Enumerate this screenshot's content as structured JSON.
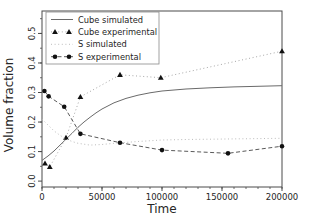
{
  "figure": {
    "background": "#ffffff",
    "axes_color": "#4a4a4a",
    "text_color": "#262626",
    "legend_border_color": "#8a8a8a"
  },
  "chart_data": {
    "type": "line",
    "title": "",
    "xlabel": "Time",
    "ylabel": "Volume fraction",
    "xlim": [
      0,
      200000
    ],
    "ylim": [
      -0.02,
      0.576
    ],
    "x_ticks": [
      0,
      50000,
      100000,
      150000,
      200000
    ],
    "x_tick_labels": [
      "0",
      "50000",
      "100000",
      "150000",
      "200000"
    ],
    "x_minor_step": 10000,
    "y_ticks": [
      0.0,
      0.1,
      0.2,
      0.3,
      0.4,
      0.5
    ],
    "y_tick_labels": [
      "0.0",
      "0.1",
      "0.2",
      "0.3",
      "0.4",
      "0.5"
    ],
    "y_minor_step": 0.05,
    "grid": false,
    "legend_position": "upper left",
    "series": [
      {
        "name": "Cube simulated",
        "style": "solid",
        "color": "#6a6a6a",
        "marker": "none",
        "marker_color": "#111111",
        "points": [
          [
            0,
            0.07
          ],
          [
            5000,
            0.085
          ],
          [
            10000,
            0.102
          ],
          [
            15000,
            0.122
          ],
          [
            20000,
            0.142
          ],
          [
            25000,
            0.162
          ],
          [
            30000,
            0.182
          ],
          [
            35000,
            0.2
          ],
          [
            40000,
            0.216
          ],
          [
            45000,
            0.231
          ],
          [
            50000,
            0.244
          ],
          [
            60000,
            0.265
          ],
          [
            70000,
            0.28
          ],
          [
            80000,
            0.291
          ],
          [
            90000,
            0.299
          ],
          [
            100000,
            0.305
          ],
          [
            120000,
            0.312
          ],
          [
            140000,
            0.316
          ],
          [
            160000,
            0.319
          ],
          [
            180000,
            0.321
          ],
          [
            200000,
            0.323
          ]
        ]
      },
      {
        "name": "Cube experimental",
        "style": "dotted",
        "color": "#a8a8a8",
        "marker": "triangle",
        "marker_color": "#111111",
        "points": [
          [
            2500,
            0.06
          ],
          [
            6500,
            0.048
          ],
          [
            20000,
            0.147
          ],
          [
            32000,
            0.285
          ],
          [
            65000,
            0.36
          ],
          [
            99000,
            0.35
          ],
          [
            200000,
            0.44
          ]
        ]
      },
      {
        "name": "S simulated",
        "style": "dotted",
        "color": "#bcbcbc",
        "marker": "none",
        "marker_color": "#111111",
        "points": [
          [
            0,
            0.21
          ],
          [
            5000,
            0.19
          ],
          [
            10000,
            0.17
          ],
          [
            15000,
            0.155
          ],
          [
            20000,
            0.143
          ],
          [
            25000,
            0.134
          ],
          [
            30000,
            0.128
          ],
          [
            40000,
            0.122
          ],
          [
            50000,
            0.124
          ],
          [
            60000,
            0.128
          ],
          [
            70000,
            0.131
          ],
          [
            80000,
            0.134
          ],
          [
            100000,
            0.139
          ],
          [
            120000,
            0.141
          ],
          [
            140000,
            0.142
          ],
          [
            160000,
            0.143
          ],
          [
            180000,
            0.144
          ],
          [
            200000,
            0.145
          ]
        ]
      },
      {
        "name": "S experimental",
        "style": "dashed",
        "color": "#5a5a5a",
        "marker": "circle",
        "marker_color": "#111111",
        "points": [
          [
            2000,
            0.305
          ],
          [
            5500,
            0.287
          ],
          [
            18500,
            0.252
          ],
          [
            32000,
            0.16
          ],
          [
            65000,
            0.13
          ],
          [
            100000,
            0.105
          ],
          [
            155000,
            0.094
          ],
          [
            200000,
            0.118
          ]
        ]
      }
    ]
  }
}
